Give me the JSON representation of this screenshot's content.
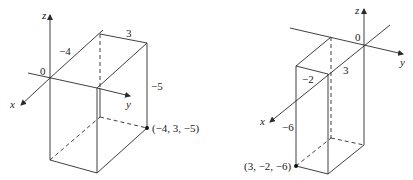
{
  "left_figure": {
    "axes": {
      "x": "x",
      "y": "y",
      "z": "z"
    },
    "origin": "0",
    "dimensions": {
      "x_edge": "−4",
      "y_edge": "3",
      "z_edge": "−5"
    },
    "point_label": "(−4, 3, −5)"
  },
  "right_figure": {
    "axes": {
      "x": "x",
      "y": "y",
      "z": "z"
    },
    "origin": "0",
    "dimensions": {
      "x_edge": "3",
      "y_edge": "−2",
      "z_edge": "−6"
    },
    "point_label": "(3, −2, −6)"
  }
}
